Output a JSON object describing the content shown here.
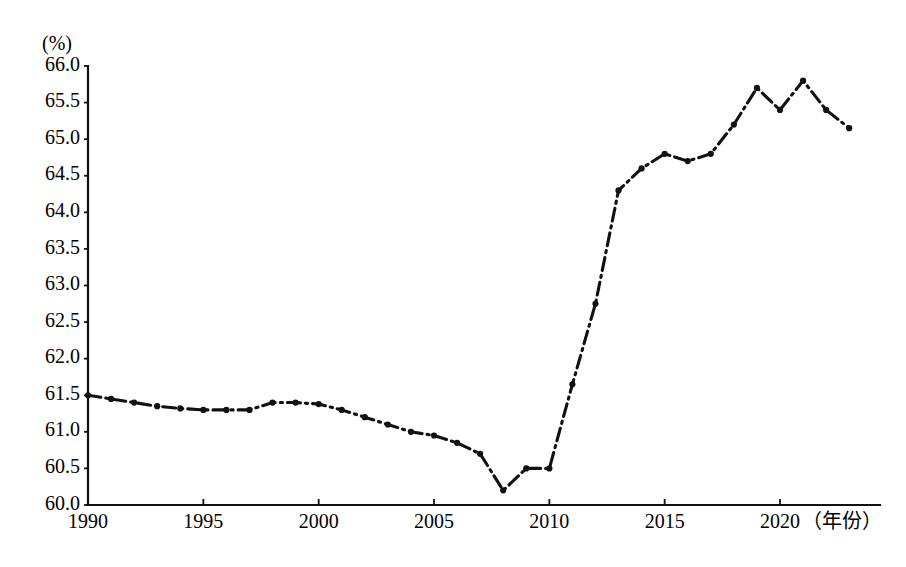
{
  "chart_data": {
    "type": "line",
    "title": "",
    "subtitle": "",
    "xlabel": "（年份）",
    "ylabel": "(%)",
    "ylim": [
      60.0,
      66.0
    ],
    "xlim": [
      1990,
      2023
    ],
    "grid": false,
    "legend": null,
    "y_ticks": [
      "66.0",
      "65.5",
      "65.0",
      "64.5",
      "64.0",
      "63.5",
      "63.0",
      "62.5",
      "62.0",
      "61.5",
      "61.0",
      "60.5",
      "60.0"
    ],
    "y_tick_values": [
      66.0,
      65.5,
      65.0,
      64.5,
      64.0,
      63.5,
      63.0,
      62.5,
      62.0,
      61.5,
      61.0,
      60.5,
      60.0
    ],
    "x_ticks": [
      "1990",
      "1995",
      "2000",
      "2005",
      "2010",
      "2015",
      "2020"
    ],
    "x_tick_values": [
      1990,
      1995,
      2000,
      2005,
      2010,
      2015,
      2020
    ],
    "line_style": "dash-dot",
    "line_color": "#111111",
    "marker": "dot",
    "x": [
      1990,
      1991,
      1992,
      1993,
      1994,
      1995,
      1996,
      1997,
      1998,
      1999,
      2000,
      2001,
      2002,
      2003,
      2004,
      2005,
      2006,
      2007,
      2008,
      2009,
      2010,
      2011,
      2012,
      2013,
      2014,
      2015,
      2016,
      2017,
      2018,
      2019,
      2020,
      2021,
      2022,
      2023
    ],
    "values": [
      61.5,
      61.45,
      61.4,
      61.35,
      61.32,
      61.3,
      61.3,
      61.3,
      61.4,
      61.4,
      61.38,
      61.3,
      61.2,
      61.1,
      61.0,
      60.95,
      60.85,
      60.7,
      60.2,
      60.5,
      60.5,
      61.65,
      62.75,
      64.3,
      64.6,
      64.8,
      64.7,
      64.8,
      65.2,
      65.7,
      65.4,
      65.8,
      65.4,
      65.15
    ],
    "categories": [
      "1990",
      "1991",
      "1992",
      "1993",
      "1994",
      "1995",
      "1996",
      "1997",
      "1998",
      "1999",
      "2000",
      "2001",
      "2002",
      "2003",
      "2004",
      "2005",
      "2006",
      "2007",
      "2008",
      "2009",
      "2010",
      "2011",
      "2012",
      "2013",
      "2014",
      "2015",
      "2016",
      "2017",
      "2018",
      "2019",
      "2020",
      "2021",
      "2022",
      "2023"
    ],
    "series": [
      {
        "name": "",
        "values": [
          61.5,
          61.45,
          61.4,
          61.35,
          61.32,
          61.3,
          61.3,
          61.3,
          61.4,
          61.4,
          61.38,
          61.3,
          61.2,
          61.1,
          61.0,
          60.95,
          60.85,
          60.7,
          60.2,
          60.5,
          60.5,
          61.65,
          62.75,
          64.3,
          64.6,
          64.8,
          64.7,
          64.8,
          65.2,
          65.7,
          65.4,
          65.8,
          65.4,
          65.15
        ]
      }
    ],
    "annotations": []
  },
  "axes": {
    "unit_label": "(%)",
    "x_axis_title": "（年份）"
  }
}
